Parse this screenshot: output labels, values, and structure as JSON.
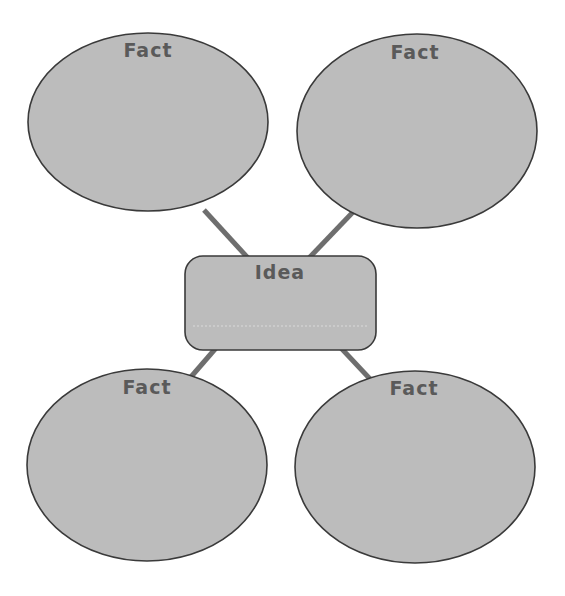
{
  "diagram": {
    "type": "idea-web",
    "center": {
      "label": "Idea"
    },
    "facts": [
      {
        "position": "top-left",
        "label": "Fact"
      },
      {
        "position": "top-right",
        "label": "Fact"
      },
      {
        "position": "bottom-left",
        "label": "Fact"
      },
      {
        "position": "bottom-right",
        "label": "Fact"
      }
    ],
    "colors": {
      "shape_fill": "#bcbcbc",
      "shape_stroke": "#3a3a3a",
      "connector": "#6e6e6e",
      "label_text": "#5a5a5a",
      "background": "#ffffff"
    }
  }
}
